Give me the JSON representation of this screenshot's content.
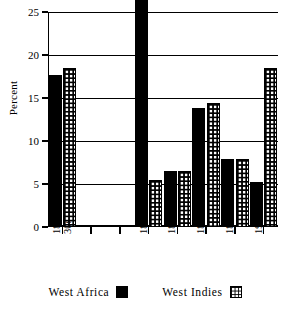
{
  "chart_data": {
    "type": "bar",
    "title": "",
    "xlabel": "",
    "ylabel": "Percent",
    "ylim": [
      0,
      25
    ],
    "yticks": [
      0,
      5,
      10,
      15,
      20,
      25
    ],
    "grid": true,
    "legend_position": "bottom",
    "categories": [
      "1820s/30s",
      "",
      "",
      "1860s",
      "1870s",
      "1880s",
      "1890s",
      "1900s"
    ],
    "category_lines": [
      [
        "1820s/",
        "30s"
      ],
      [
        ""
      ],
      [
        ""
      ],
      [
        "1860s"
      ],
      [
        "1870s"
      ],
      [
        "1880s"
      ],
      [
        "1890s"
      ],
      [
        "1900s"
      ]
    ],
    "series": [
      {
        "name": "West Africa",
        "fill": "solid-black",
        "color": "#000000",
        "values": [
          17.7,
          null,
          null,
          26.5,
          6.5,
          13.8,
          7.9,
          5.2
        ],
        "notes": [
          "",
          "",
          "",
          "bar exceeds axis maximum and is clipped at 25",
          "",
          "",
          "",
          ""
        ]
      },
      {
        "name": "West Indies",
        "fill": "grid-hatch",
        "color": "#000000",
        "values": [
          18.5,
          null,
          null,
          5.5,
          6.5,
          14.4,
          7.9,
          18.5
        ],
        "notes": [
          "",
          "",
          "",
          "",
          "",
          "",
          "",
          ""
        ]
      }
    ]
  },
  "axis": {
    "y_title": "Percent",
    "y_tick_labels": [
      "25",
      "20",
      "15",
      "10",
      "5",
      "0"
    ]
  },
  "legend": {
    "items": [
      {
        "label": "West Africa",
        "swatch": "solid-black-square-icon"
      },
      {
        "label": "West Indies",
        "swatch": "grid-hatch-square-icon"
      }
    ]
  }
}
